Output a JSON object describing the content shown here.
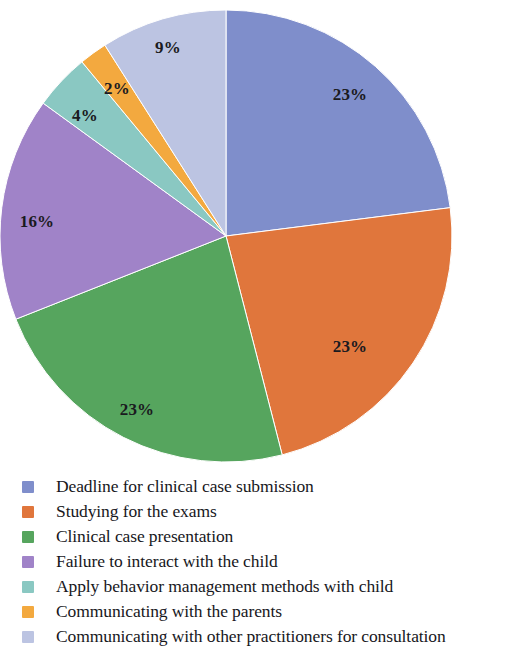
{
  "chart_data": {
    "type": "pie",
    "title": "",
    "subtitle": "",
    "xlabel": "",
    "ylabel": "",
    "grid": false,
    "legend_position": "bottom-left",
    "start_angle_deg": 0,
    "direction": "clockwise",
    "center": {
      "x": 226,
      "y": 236
    },
    "radius": 226,
    "categories": [
      "Deadline for clinical case submission",
      "Studying for the exams",
      "Clinical case presentation",
      "Failure to interact with the child",
      "Apply behavior management methods with child",
      "Communicating with the parents",
      "Communicating with other practitioners for consultation"
    ],
    "values": [
      23,
      23,
      23,
      16,
      4,
      2,
      9
    ],
    "value_labels": [
      "23%",
      "23%",
      "23%",
      "16%",
      "4%",
      "2%",
      "9%"
    ],
    "colors": [
      "#7f8ecb",
      "#e0763c",
      "#56a55e",
      "#a083c8",
      "#8ac8c2",
      "#f3a93f",
      "#bcc4e2"
    ],
    "unit": "%",
    "slices": [
      {
        "label": "Deadline for clinical case submission",
        "value": 23,
        "value_label": "23%",
        "color": "#7f8ecb",
        "start_deg": 0,
        "end_deg": 82.8,
        "label_x": 350,
        "label_y": 95
      },
      {
        "label": "Studying for the exams",
        "value": 23,
        "value_label": "23%",
        "color": "#e0763c",
        "start_deg": 82.8,
        "end_deg": 165.6,
        "label_x": 350,
        "label_y": 347
      },
      {
        "label": "Clinical case presentation",
        "value": 23,
        "value_label": "23%",
        "color": "#56a55e",
        "start_deg": 165.6,
        "end_deg": 248.4,
        "label_x": 137,
        "label_y": 410
      },
      {
        "label": "Failure to interact with the child",
        "value": 16,
        "value_label": "16%",
        "color": "#a083c8",
        "start_deg": 248.4,
        "end_deg": 306.0,
        "label_x": 37,
        "label_y": 222
      },
      {
        "label": "Apply behavior management methods with child",
        "value": 4,
        "value_label": "4%",
        "color": "#8ac8c2",
        "start_deg": 306.0,
        "end_deg": 320.4,
        "label_x": 85,
        "label_y": 116
      },
      {
        "label": "Communicating with the parents",
        "value": 2,
        "value_label": "2%",
        "color": "#f3a93f",
        "start_deg": 320.4,
        "end_deg": 327.6,
        "label_x": 117,
        "label_y": 89
      },
      {
        "label": "Communicating with other practitioners for consultation",
        "value": 9,
        "value_label": "9%",
        "color": "#bcc4e2",
        "start_deg": 327.6,
        "end_deg": 360.0,
        "label_x": 168,
        "label_y": 48
      }
    ]
  },
  "legend": {
    "items": [
      {
        "label": "Deadline for clinical case submission",
        "color": "#7f8ecb"
      },
      {
        "label": "Studying for the exams",
        "color": "#e0763c"
      },
      {
        "label": "Clinical case presentation",
        "color": "#56a55e"
      },
      {
        "label": "Failure to interact with the child",
        "color": "#a083c8"
      },
      {
        "label": "Apply behavior management methods with child",
        "color": "#8ac8c2"
      },
      {
        "label": "Communicating with the parents",
        "color": "#f3a93f"
      },
      {
        "label": "Communicating with other practitioners for consultation",
        "color": "#bcc4e2"
      }
    ]
  }
}
